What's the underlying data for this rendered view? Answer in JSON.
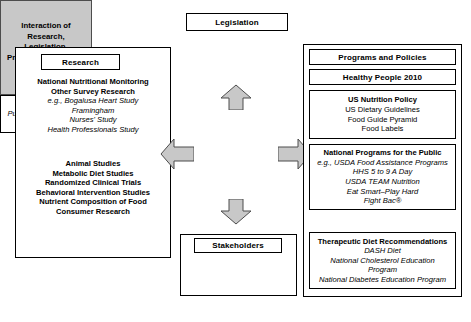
{
  "diagram": {
    "title_node": {
      "label": "Legislation"
    },
    "center": {
      "lines": [
        "Interaction of",
        "Research,",
        "Legislation,",
        "Programs & Policies,",
        "and People"
      ],
      "fill_color": "#c8c8c8",
      "border_color": "#4d4d4d"
    },
    "arrows": {
      "up": "arrow-up",
      "down": "arrow-down",
      "left": "arrow-left",
      "right": "arrow-right",
      "fill_color": "#c8c8c8",
      "stroke_color": "#4d4d4d"
    },
    "research": {
      "title": "Research",
      "group_a": [
        {
          "text": "National Nutritional Monitoring",
          "style": "bold"
        },
        {
          "text": "Other Survey Research",
          "style": "bold"
        },
        {
          "text": "e.g., Bogalusa Heart Study",
          "style": "italic"
        },
        {
          "text": "Framingham",
          "style": "italic"
        },
        {
          "text": "Nurses' Study",
          "style": "italic"
        },
        {
          "text": "Health Professionals Study",
          "style": "italic"
        }
      ],
      "group_b": [
        {
          "text": "Animal Studies",
          "style": "bold"
        },
        {
          "text": "Metabolic Diet Studies",
          "style": "bold"
        },
        {
          "text": "Randomized Clinical Trials",
          "style": "bold"
        },
        {
          "text": "Behavioral Intervention Studies",
          "style": "bold"
        },
        {
          "text": "Nutrient Composition of Food",
          "style": "bold"
        },
        {
          "text": "Consumer Research",
          "style": "bold"
        }
      ]
    },
    "stakeholders": {
      "title": "Stakeholders",
      "items": [
        {
          "text": "Consumers",
          "style": "italic"
        },
        {
          "text": "Public Interest Groups",
          "style": "italic"
        },
        {
          "text": "Industry",
          "style": "italic"
        }
      ]
    },
    "right_column": {
      "heading_1": "Programs and Policies",
      "heading_2": "Healthy People 2010",
      "us_nutrition_policy": [
        {
          "text": "US Nutrition Policy",
          "style": "bold"
        },
        {
          "text": "US Dietary Guidelines",
          "style": "normal"
        },
        {
          "text": "Food Guide Pyramid",
          "style": "normal"
        },
        {
          "text": "Food Labels",
          "style": "normal"
        }
      ],
      "national_programs": [
        {
          "text": "National Programs for the Public",
          "style": "bold"
        },
        {
          "text": "e.g., USDA Food Assistance Programs",
          "style": "italic"
        },
        {
          "text": "HHS 5 to 9 A Day",
          "style": "italic"
        },
        {
          "text": "USDA TEAM Nutrition",
          "style": "italic"
        },
        {
          "text": "Eat Smart–Play Hard",
          "style": "italic"
        },
        {
          "text": "Fight Bac®",
          "style": "italic"
        }
      ],
      "therapeutic": [
        {
          "text": "Therapeutic Diet Recommendations",
          "style": "bold"
        },
        {
          "text": "DASH Diet",
          "style": "italic"
        },
        {
          "text": "National Cholesterol Education",
          "style": "italic"
        },
        {
          "text": "Program",
          "style": "italic"
        },
        {
          "text": "National Diabetes Education Program",
          "style": "italic"
        }
      ]
    }
  }
}
